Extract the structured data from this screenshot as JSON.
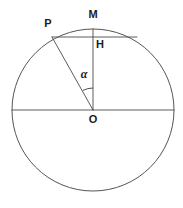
{
  "figure": {
    "background_color": "#ffffff",
    "stroke_color": "#4a4a4a",
    "label_color": "#1b1b1b",
    "width": 183,
    "height": 208
  },
  "labels": {
    "point_m": "M",
    "point_p": "P",
    "point_h": "H",
    "point_o": "O",
    "angle_alpha": "α"
  },
  "geometry": {
    "circle": {
      "cx": 93,
      "cy": 110,
      "r": 81
    },
    "points": {
      "O": {
        "x": 93,
        "y": 110
      },
      "M": {
        "x": 93,
        "y": 29
      },
      "P": {
        "x": 52,
        "y": 37
      },
      "H": {
        "x": 93,
        "y": 37
      },
      "chord_right_end": {
        "x": 137,
        "y": 37
      },
      "diameter_left": {
        "x": 12,
        "y": 110
      },
      "diameter_right": {
        "x": 174,
        "y": 110
      }
    },
    "label_positions": {
      "M": {
        "x": 93,
        "y": 15
      },
      "P": {
        "x": 48,
        "y": 24
      },
      "H": {
        "x": 100,
        "y": 45
      },
      "O": {
        "x": 93,
        "y": 120
      },
      "alpha": {
        "x": 84,
        "y": 75
      }
    },
    "angle_arc": {
      "radius": 22,
      "from_deg": 90,
      "to_deg": 117,
      "label": "α"
    }
  }
}
